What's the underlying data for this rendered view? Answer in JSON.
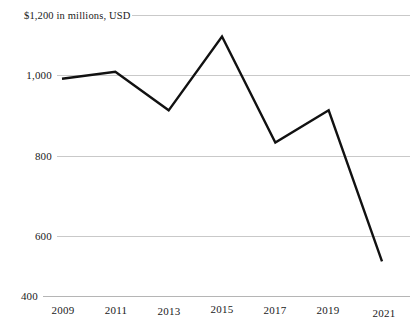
{
  "chart_data": {
    "type": "line",
    "title": "",
    "subtitle": "",
    "unit_label": "$1,200 in millions, USD",
    "xlabel": "",
    "ylabel": "",
    "categories": [
      "2009",
      "2011",
      "2013",
      "2015",
      "2017",
      "2019",
      "2021"
    ],
    "x": [
      2009,
      2011,
      2013,
      2015,
      2017,
      2019,
      2021
    ],
    "values": [
      1020,
      1040,
      930,
      1140,
      838,
      930,
      500
    ],
    "series": [
      {
        "name": "",
        "values": [
          1020,
          1040,
          930,
          1140,
          838,
          930,
          500
        ]
      }
    ],
    "ylim": [
      400,
      1200
    ],
    "xlim": [
      2009,
      2021
    ],
    "ytick_labels": [
      "1,200",
      "1,000",
      "800",
      "600",
      "400"
    ],
    "ytick_values": [
      1200,
      1000,
      800,
      600,
      400
    ],
    "xtick_labels": [
      "2009",
      "2011",
      "2013",
      "2015",
      "2017",
      "2019",
      "2021"
    ],
    "grid": true,
    "legend": "none",
    "line_color": "#111111",
    "grid_color": "#c9c9c9",
    "background_color": "#ffffff"
  },
  "axis": {
    "y": {
      "t1200": "1,200",
      "t1000": "1,000",
      "t800": "800",
      "t600": "600",
      "t400": "400"
    },
    "x": {
      "t2009": "2009",
      "t2011": "2011",
      "t2013": "2013",
      "t2015": "2015",
      "t2017": "2017",
      "t2019": "2019",
      "t2021": "2021"
    }
  },
  "annotations": {
    "unit_note": "$1,200 in millions, USD"
  }
}
